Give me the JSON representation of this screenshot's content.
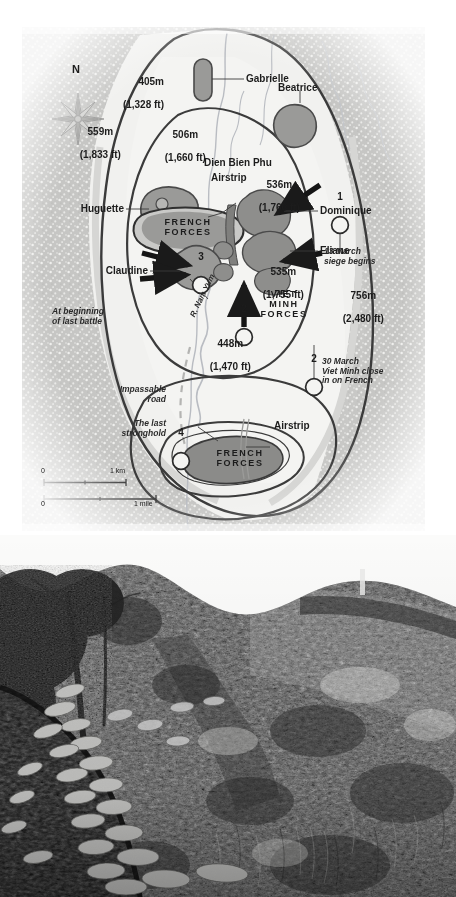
{
  "page": {
    "background_color": "#ffffff"
  },
  "map": {
    "name": "Dien Bien Phu battle map",
    "background_color": "#f2f2f0",
    "terrain_color": "#c9c9c7",
    "valley_color": "#f0f0ee",
    "hill_fill": "#9a9a9a",
    "stronghold_fill": "#8f8f8f",
    "line_color": "#3a3a3a",
    "compass": {
      "north_label": "N",
      "icon": "compass-rose-icon"
    },
    "elevations": [
      {
        "id": "elev-405",
        "meters": "405m",
        "feet": "(1,328 ft)"
      },
      {
        "id": "elev-559",
        "meters": "559m",
        "feet": "(1,833 ft)"
      },
      {
        "id": "elev-506",
        "meters": "506m",
        "feet": "(1,660 ft)"
      },
      {
        "id": "elev-536",
        "meters": "536m",
        "feet": "(1,760 ft)"
      },
      {
        "id": "elev-535",
        "meters": "535m",
        "feet": "(1,755 ft)"
      },
      {
        "id": "elev-756",
        "meters": "756m",
        "feet": "(2,480 ft)"
      },
      {
        "id": "elev-448",
        "meters": "448m",
        "feet": "(1,470 ft)"
      }
    ],
    "strongpoints": [
      {
        "id": "gabrielle",
        "label": "Gabrielle"
      },
      {
        "id": "beatrice",
        "label": "Beatrice"
      },
      {
        "id": "dominique",
        "label": "Dominique"
      },
      {
        "id": "eliane",
        "label": "Eliane"
      },
      {
        "id": "huguette",
        "label": "Huguette"
      },
      {
        "id": "claudine",
        "label": "Claudine"
      }
    ],
    "place_labels": {
      "dien_bien_phu": "Dien Bien Phu",
      "airstrip_top": "Airstrip",
      "airstrip_bottom": "Airstrip",
      "river": "R. Nam Yum"
    },
    "forces": {
      "french_top": "FRENCH\nFORCES",
      "french_bottom": "FRENCH\nFORCES",
      "viet_minh": "VIET\nMINH\nFORCES"
    },
    "annotations": {
      "siege_begins": "13 March\nsiege begins",
      "close_in": "30 March\nViet Minh close\nin on French",
      "last_battle": "At beginning\nof last battle",
      "impassable_road": "Impassable\nroad",
      "last_stronghold": "The last\nstronghold"
    },
    "phase_markers": [
      {
        "id": "marker-1",
        "label": "1"
      },
      {
        "id": "marker-2-upper",
        "label": "2"
      },
      {
        "id": "marker-2-lower",
        "label": "2"
      },
      {
        "id": "marker-3",
        "label": "3"
      },
      {
        "id": "marker-4",
        "label": "4"
      }
    ],
    "scale_bar": {
      "km_zero": "0",
      "km_label": "1 km",
      "mile_zero": "0",
      "mile_label": "1 mile"
    }
  },
  "photo": {
    "name": "overgrown-trench-photograph",
    "description": "Black and white photograph of an overgrown sandbagged trench line on a hillside at Dien Bien Phu",
    "palette": {
      "sky": "#f4f4f2",
      "foliage_light": "#8c8c8c",
      "foliage_dark": "#303030",
      "sandbag": "#c6c6c6",
      "shadow": "#131313"
    }
  }
}
